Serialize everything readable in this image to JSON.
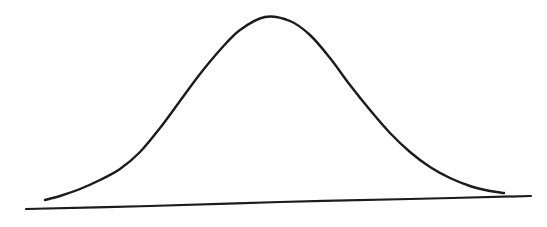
{
  "figure": {
    "title": "",
    "caption": "",
    "background_color": "#ffffff",
    "ink_color": "#1a1a1a",
    "width": 547,
    "height": 227,
    "medium": "scanned hand-drawn line drawing"
  },
  "chart_data": {
    "type": "line",
    "title": "",
    "subtitle": "",
    "xlabel": "",
    "ylabel": "",
    "legend": [],
    "legend_position": "none",
    "grid": false,
    "annotations": [],
    "axis": {
      "x_axis_visible": true,
      "y_axis_visible": false,
      "x_tick_labels": [],
      "y_tick_labels": [],
      "xlim": [
        26,
        531
      ],
      "ylim": [
        17,
        209
      ]
    },
    "series": [
      {
        "name": "bell-curve",
        "description": "hand-drawn normal distribution curve",
        "stroke_color": "#1a1a1a",
        "stroke_width": 2.4,
        "fill": "none",
        "peak": {
          "x": 265,
          "y": 17
        },
        "start": {
          "x": 45,
          "y": 200
        },
        "end": {
          "x": 504,
          "y": 193
        },
        "points": [
          {
            "x": 45,
            "y": 200
          },
          {
            "x": 60,
            "y": 196
          },
          {
            "x": 80,
            "y": 189
          },
          {
            "x": 100,
            "y": 180
          },
          {
            "x": 120,
            "y": 169
          },
          {
            "x": 140,
            "y": 152
          },
          {
            "x": 160,
            "y": 128
          },
          {
            "x": 180,
            "y": 101
          },
          {
            "x": 200,
            "y": 74
          },
          {
            "x": 220,
            "y": 50
          },
          {
            "x": 240,
            "y": 30
          },
          {
            "x": 265,
            "y": 17
          },
          {
            "x": 290,
            "y": 21
          },
          {
            "x": 310,
            "y": 35
          },
          {
            "x": 330,
            "y": 58
          },
          {
            "x": 350,
            "y": 85
          },
          {
            "x": 370,
            "y": 110
          },
          {
            "x": 390,
            "y": 133
          },
          {
            "x": 410,
            "y": 152
          },
          {
            "x": 430,
            "y": 167
          },
          {
            "x": 450,
            "y": 178
          },
          {
            "x": 470,
            "y": 186
          },
          {
            "x": 490,
            "y": 191
          },
          {
            "x": 504,
            "y": 193
          }
        ]
      },
      {
        "name": "baseline",
        "description": "hand-drawn horizontal axis line, tilted slightly upward to the right",
        "stroke_color": "#1a1a1a",
        "stroke_width": 2.2,
        "fill": "none",
        "start": {
          "x": 26,
          "y": 209
        },
        "end": {
          "x": 531,
          "y": 196
        },
        "points": [
          {
            "x": 26,
            "y": 209
          },
          {
            "x": 150,
            "y": 206
          },
          {
            "x": 280,
            "y": 202
          },
          {
            "x": 410,
            "y": 199
          },
          {
            "x": 531,
            "y": 196
          }
        ]
      }
    ]
  }
}
